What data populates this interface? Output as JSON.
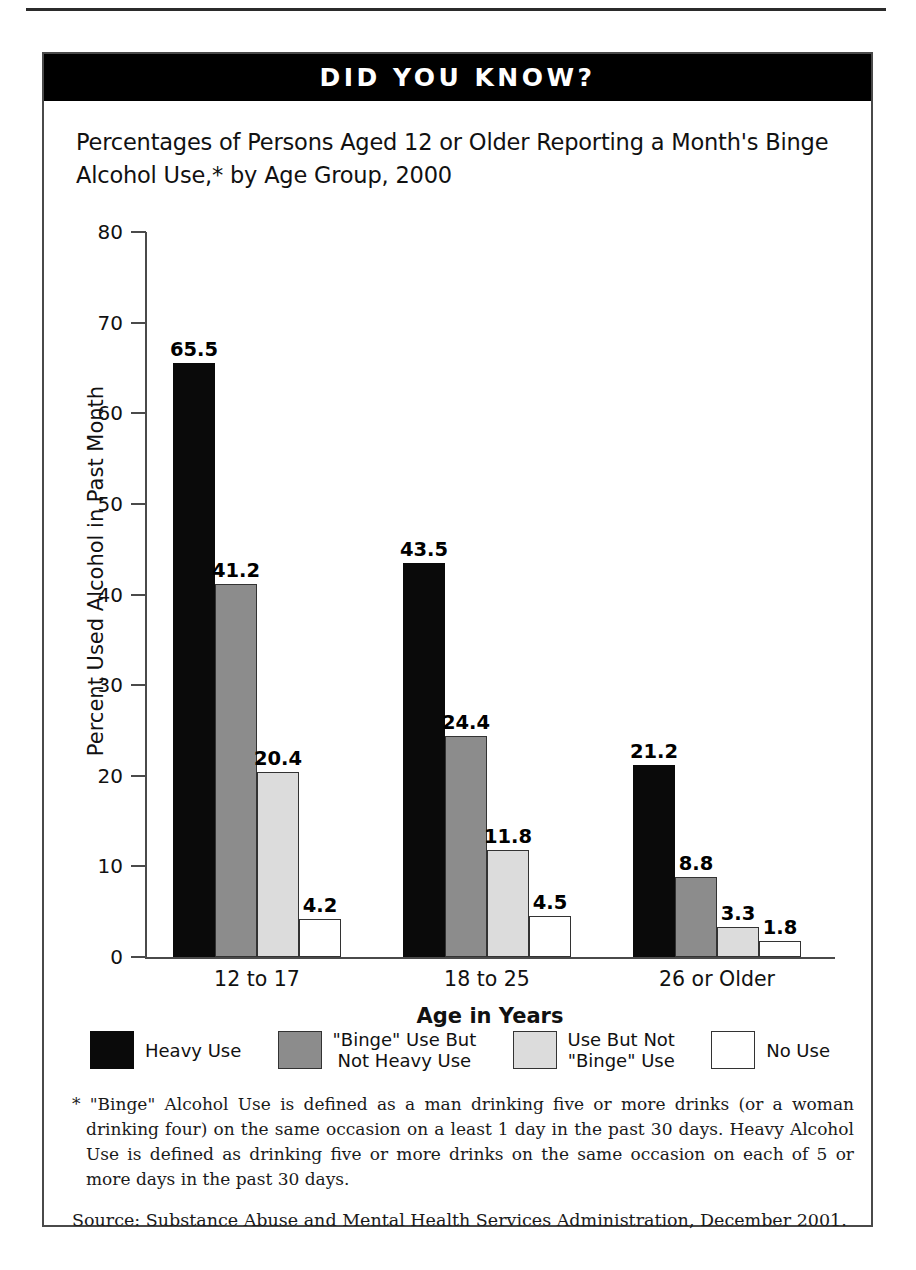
{
  "banner": {
    "text": "DID YOU KNOW?"
  },
  "chart_data": {
    "type": "bar",
    "title": "Percentages of Persons Aged 12 or Older Reporting a Month's Binge Alcohol Use,* by Age Group, 2000",
    "xlabel": "Age in Years",
    "ylabel": "Percent Used Alcohol in Past Month",
    "ylim": [
      0,
      80
    ],
    "yticks": [
      0,
      10,
      20,
      30,
      40,
      50,
      60,
      70,
      80
    ],
    "ytick_labels": [
      "0",
      "10",
      "20",
      "30",
      "40",
      "50",
      "60",
      "70",
      "80"
    ],
    "grid": false,
    "legend_position": "bottom",
    "categories": [
      "12 to 17",
      "18 to 25",
      "26 or Older"
    ],
    "series": [
      {
        "name": "Heavy Use",
        "label_lines": "Heavy Use",
        "color": "#0a0a0a",
        "values": [
          65.5,
          43.5,
          21.2
        ]
      },
      {
        "name": "\"Binge\" Use But Not Heavy Use",
        "label_lines": "\"Binge\" Use But\nNot Heavy Use",
        "color": "#8c8c8c",
        "values": [
          41.2,
          24.4,
          8.8
        ]
      },
      {
        "name": "Use But Not \"Binge\" Use",
        "label_lines": "Use But Not\n\"Binge\" Use",
        "color": "#dcdcdc",
        "values": [
          20.4,
          11.8,
          3.3
        ]
      },
      {
        "name": "No Use",
        "label_lines": "No Use",
        "color": "#ffffff",
        "values": [
          4.2,
          4.5,
          1.8
        ]
      }
    ],
    "value_labels": [
      [
        "65.5",
        "41.2",
        "20.4",
        "4.2"
      ],
      [
        "43.5",
        "24.4",
        "11.8",
        "4.5"
      ],
      [
        "21.2",
        "8.8",
        "3.3",
        "1.8"
      ]
    ]
  },
  "notes": {
    "footnote": "* \"Binge\" Alcohol Use is defined as a man drinking five or more drinks (or a woman drinking four) on the same occasion on a least 1 day in the past 30 days. Heavy Alcohol Use is defined as drinking five or more drinks on the  same occasion on each of 5 or more days in the past 30 days.",
    "source": "Source:  Substance Abuse and Mental Health Services Administration, December 2001."
  }
}
